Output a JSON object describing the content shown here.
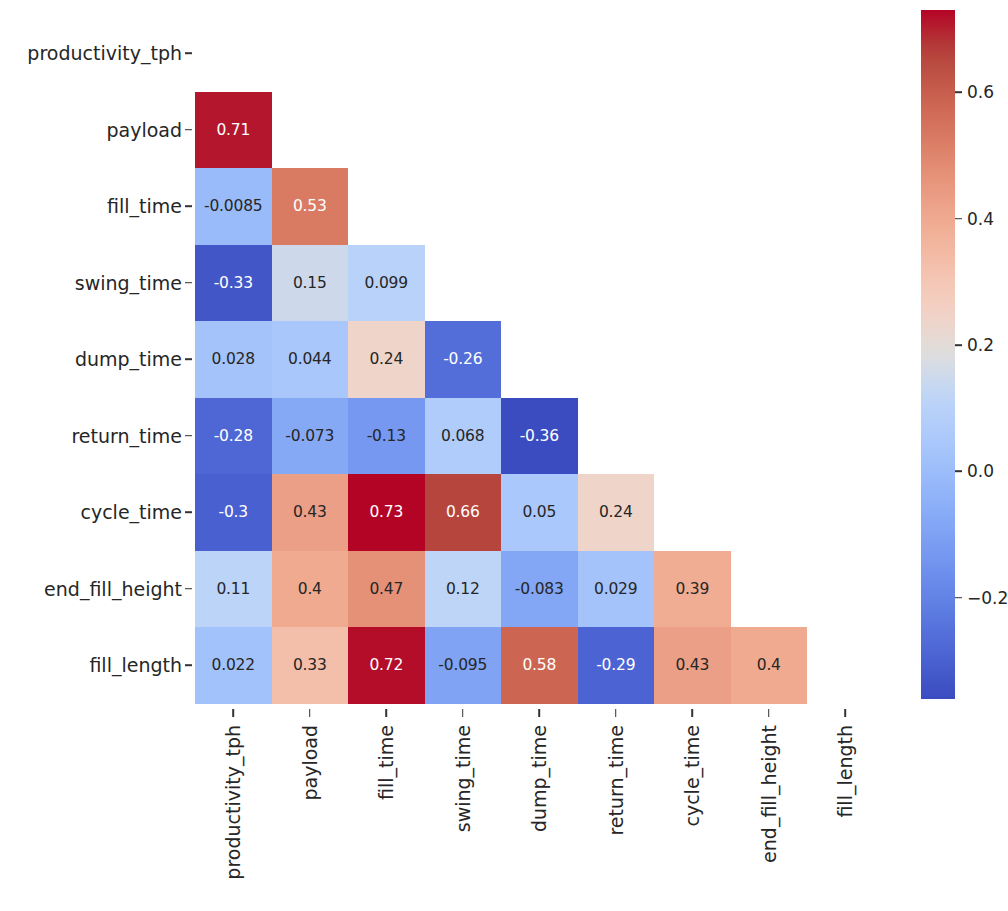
{
  "chart_data": {
    "type": "heatmap",
    "title": "",
    "xlabel": "",
    "ylabel": "",
    "mask": "lower-triangle (excluding diagonal)",
    "grid": false,
    "annotated": true,
    "colormap": "coolwarm",
    "colorbar": {
      "position": "right",
      "orientation": "vertical",
      "vmin": -0.36,
      "vmax": 0.73,
      "ticks": [
        0.6,
        0.4,
        0.2,
        0.0,
        -0.2
      ],
      "tick_labels": [
        "0.6",
        "0.4",
        "0.2",
        "0.0",
        "−0.2"
      ]
    },
    "categories": [
      "productivity_tph",
      "payload",
      "fill_time",
      "swing_time",
      "dump_time",
      "return_time",
      "cycle_time",
      "end_fill_height",
      "fill_length"
    ],
    "x_tick_labels": [
      "productivity_tph",
      "payload",
      "fill_time",
      "swing_time",
      "dump_time",
      "return_time",
      "cycle_time",
      "end_fill_height",
      "fill_length"
    ],
    "y_tick_labels": [
      "productivity_tph",
      "payload",
      "fill_time",
      "swing_time",
      "dump_time",
      "return_time",
      "cycle_time",
      "end_fill_height",
      "fill_length"
    ],
    "cells": [
      {
        "row": 1,
        "col": 0,
        "value": 0.71,
        "label": "0.71"
      },
      {
        "row": 2,
        "col": 0,
        "value": -0.0085,
        "label": "-0.0085"
      },
      {
        "row": 2,
        "col": 1,
        "value": 0.53,
        "label": "0.53"
      },
      {
        "row": 3,
        "col": 0,
        "value": -0.33,
        "label": "-0.33"
      },
      {
        "row": 3,
        "col": 1,
        "value": 0.15,
        "label": "0.15"
      },
      {
        "row": 3,
        "col": 2,
        "value": 0.099,
        "label": "0.099"
      },
      {
        "row": 4,
        "col": 0,
        "value": 0.028,
        "label": "0.028"
      },
      {
        "row": 4,
        "col": 1,
        "value": 0.044,
        "label": "0.044"
      },
      {
        "row": 4,
        "col": 2,
        "value": 0.24,
        "label": "0.24"
      },
      {
        "row": 4,
        "col": 3,
        "value": -0.26,
        "label": "-0.26"
      },
      {
        "row": 5,
        "col": 0,
        "value": -0.28,
        "label": "-0.28"
      },
      {
        "row": 5,
        "col": 1,
        "value": -0.073,
        "label": "-0.073"
      },
      {
        "row": 5,
        "col": 2,
        "value": -0.13,
        "label": "-0.13"
      },
      {
        "row": 5,
        "col": 3,
        "value": 0.068,
        "label": "0.068"
      },
      {
        "row": 5,
        "col": 4,
        "value": -0.36,
        "label": "-0.36"
      },
      {
        "row": 6,
        "col": 0,
        "value": -0.3,
        "label": "-0.3"
      },
      {
        "row": 6,
        "col": 1,
        "value": 0.43,
        "label": "0.43"
      },
      {
        "row": 6,
        "col": 2,
        "value": 0.73,
        "label": "0.73"
      },
      {
        "row": 6,
        "col": 3,
        "value": 0.66,
        "label": "0.66"
      },
      {
        "row": 6,
        "col": 4,
        "value": 0.05,
        "label": "0.05"
      },
      {
        "row": 6,
        "col": 5,
        "value": 0.24,
        "label": "0.24"
      },
      {
        "row": 7,
        "col": 0,
        "value": 0.11,
        "label": "0.11"
      },
      {
        "row": 7,
        "col": 1,
        "value": 0.4,
        "label": "0.4"
      },
      {
        "row": 7,
        "col": 2,
        "value": 0.47,
        "label": "0.47"
      },
      {
        "row": 7,
        "col": 3,
        "value": 0.12,
        "label": "0.12"
      },
      {
        "row": 7,
        "col": 4,
        "value": -0.083,
        "label": "-0.083"
      },
      {
        "row": 7,
        "col": 5,
        "value": 0.029,
        "label": "0.029"
      },
      {
        "row": 7,
        "col": 6,
        "value": 0.39,
        "label": "0.39"
      },
      {
        "row": 8,
        "col": 0,
        "value": 0.022,
        "label": "0.022"
      },
      {
        "row": 8,
        "col": 1,
        "value": 0.33,
        "label": "0.33"
      },
      {
        "row": 8,
        "col": 2,
        "value": 0.72,
        "label": "0.72"
      },
      {
        "row": 8,
        "col": 3,
        "value": -0.095,
        "label": "-0.095"
      },
      {
        "row": 8,
        "col": 4,
        "value": 0.58,
        "label": "0.58"
      },
      {
        "row": 8,
        "col": 5,
        "value": -0.29,
        "label": "-0.29"
      },
      {
        "row": 8,
        "col": 6,
        "value": 0.43,
        "label": "0.43"
      },
      {
        "row": 8,
        "col": 7,
        "value": 0.4,
        "label": "0.4"
      }
    ]
  },
  "colors": {
    "text": "#262626",
    "annotation_light": "#ffffff",
    "annotation_dark": "#262626",
    "background": "#ffffff",
    "cmap_low": "#3b4cc0",
    "cmap_mid": "#dddddd",
    "cmap_high": "#b40426"
  }
}
